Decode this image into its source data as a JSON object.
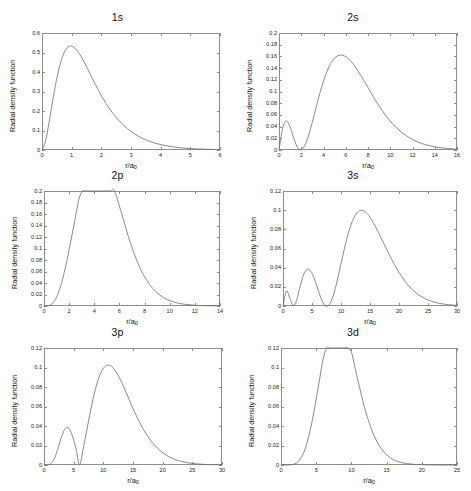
{
  "figure": {
    "title": "",
    "panel_count": 6,
    "axis": {
      "ylabel": "Radial density function",
      "xlabel_text": "r/a",
      "xlabel_sub": "0"
    },
    "style": {
      "curve_color": "#6b6b6b",
      "axis_color": "#8d8d8d",
      "text_color": "#111111",
      "background": "#ffffff"
    }
  },
  "chart_data": [
    {
      "type": "line",
      "title": "1s",
      "xlabel": "r/a0",
      "ylabel": "Radial density function",
      "xlim": [
        0,
        6
      ],
      "ylim": [
        0,
        0.6
      ],
      "xticks": [
        0,
        1,
        2,
        3,
        4,
        5,
        6
      ],
      "yticks": [
        0,
        0.1,
        0.2,
        0.3,
        0.4,
        0.5,
        0.6
      ],
      "xticklabels": [
        "0",
        "1",
        "2",
        "3",
        "4",
        "5",
        "6"
      ],
      "yticklabels": [
        "0",
        "0.1",
        "0.2",
        "0.3",
        "0.4",
        "0.5",
        "0.6"
      ],
      "grid": false,
      "legend": null,
      "formula": "4 r^2 exp(-2r)",
      "peak": {
        "x": 1.0,
        "y": 0.541
      },
      "nodes": [],
      "x": [
        0,
        0.12,
        0.24,
        0.36,
        0.48,
        0.6,
        0.72,
        0.84,
        0.96,
        1.08,
        1.2,
        1.32,
        1.44,
        1.56,
        1.68,
        1.8,
        1.92,
        2.04,
        2.16,
        2.28,
        2.4,
        2.64,
        2.88,
        3.12,
        3.36,
        3.6,
        3.84,
        4.08,
        4.32,
        4.56,
        4.8,
        5.04,
        5.28,
        5.52,
        5.76,
        6.0
      ],
      "y": [
        0,
        0.0453,
        0.1425,
        0.2516,
        0.3524,
        0.4337,
        0.4906,
        0.5227,
        0.5331,
        0.5263,
        0.5068,
        0.4787,
        0.4452,
        0.4089,
        0.3719,
        0.3355,
        0.3007,
        0.2682,
        0.2382,
        0.2109,
        0.1862,
        0.1436,
        0.1094,
        0.0826,
        0.0618,
        0.0459,
        0.0339,
        0.0249,
        0.0182,
        0.0133,
        0.0097,
        0.007,
        0.0051,
        0.0036,
        0.0026,
        0.0019
      ]
    },
    {
      "type": "line",
      "title": "2s",
      "xlabel": "r/a0",
      "ylabel": "Radial density function",
      "xlim": [
        0,
        16
      ],
      "ylim": [
        0,
        0.2
      ],
      "xticks": [
        0,
        2,
        4,
        6,
        8,
        10,
        12,
        14,
        16
      ],
      "yticks": [
        0,
        0.02,
        0.04,
        0.06,
        0.08,
        0.1,
        0.12,
        0.14,
        0.16,
        0.18,
        0.2
      ],
      "xticklabels": [
        "0",
        "2",
        "4",
        "6",
        "8",
        "10",
        "12",
        "14",
        "16"
      ],
      "yticklabels": [
        "0",
        "0.02",
        "0.04",
        "0.06",
        "0.08",
        "0.1",
        "0.12",
        "0.14",
        "0.16",
        "0.18",
        "0.2"
      ],
      "grid": false,
      "legend": null,
      "formula": "(1/8) r^2 (2-r)^2 exp(-r)",
      "peak": {
        "x": 5.24,
        "y": 0.191
      },
      "secondary_peak": {
        "x": 0.76,
        "y": 0.0513
      },
      "nodes": [
        2.0
      ],
      "x": [
        0,
        0.32,
        0.64,
        0.96,
        1.28,
        1.6,
        1.92,
        2.24,
        2.56,
        2.88,
        3.2,
        3.52,
        3.84,
        4.16,
        4.48,
        4.8,
        5.12,
        5.44,
        5.76,
        6.08,
        6.4,
        6.72,
        7.04,
        7.36,
        7.68,
        8.0,
        8.64,
        9.28,
        9.92,
        10.56,
        11.2,
        11.84,
        12.48,
        13.12,
        13.76,
        14.4,
        15.04,
        15.68,
        16.0
      ],
      "y": [
        0,
        0.0362,
        0.05,
        0.0409,
        0.023,
        0.0065,
        0.0002,
        0.005,
        0.0192,
        0.0396,
        0.0629,
        0.0864,
        0.1081,
        0.1268,
        0.1416,
        0.1524,
        0.1591,
        0.1621,
        0.1617,
        0.1585,
        0.153,
        0.1457,
        0.137,
        0.1274,
        0.1172,
        0.1068,
        0.0861,
        0.0673,
        0.0512,
        0.038,
        0.0276,
        0.0196,
        0.0137,
        0.0094,
        0.0064,
        0.0042,
        0.0028,
        0.0018,
        0.0014
      ]
    },
    {
      "type": "line",
      "title": "2p",
      "xlabel": "r/a0",
      "ylabel": "Radial density function",
      "xlim": [
        0,
        14
      ],
      "ylim": [
        0,
        0.2
      ],
      "xticks": [
        0,
        2,
        4,
        6,
        8,
        10,
        12,
        14
      ],
      "yticks": [
        0,
        0.02,
        0.04,
        0.06,
        0.08,
        0.1,
        0.12,
        0.14,
        0.16,
        0.18,
        0.2
      ],
      "xticklabels": [
        "0",
        "2",
        "4",
        "6",
        "8",
        "10",
        "12",
        "14"
      ],
      "yticklabels": [
        "0",
        "0.02",
        "0.04",
        "0.06",
        "0.08",
        "0.1",
        "0.12",
        "0.14",
        "0.16",
        "0.18",
        "0.2"
      ],
      "grid": false,
      "legend": null,
      "formula": "(1/24) r^4 exp(-r)",
      "peak": {
        "x": 4.0,
        "y": 0.1954
      },
      "nodes": [],
      "x": [
        0,
        0.28,
        0.56,
        0.84,
        1.12,
        1.4,
        1.68,
        1.96,
        2.24,
        2.52,
        2.8,
        3.08,
        3.36,
        3.64,
        3.92,
        4.2,
        4.48,
        4.76,
        5.04,
        5.32,
        5.6,
        6.16,
        6.72,
        7.28,
        7.84,
        8.4,
        8.96,
        9.52,
        10.08,
        10.64,
        11.2,
        11.76,
        12.32,
        12.88,
        13.44,
        14.0
      ],
      "y": [
        0,
        0.0002,
        0.0024,
        0.009,
        0.0216,
        0.0404,
        0.0648,
        0.0936,
        0.125,
        0.157,
        0.1876,
        0.2148,
        0.2371,
        0.2534,
        0.2631,
        0.2661,
        0.2629,
        0.2541,
        0.2407,
        0.2238,
        0.2044,
        0.162,
        0.1203,
        0.0849,
        0.0574,
        0.0374,
        0.0236,
        0.0145,
        0.0087,
        0.0051,
        0.003,
        0.0017,
        0.0009,
        0.0005,
        0.0003,
        0.0002
      ]
    },
    {
      "type": "line",
      "title": "3s",
      "xlabel": "r/a0",
      "ylabel": "Radial density function",
      "xlim": [
        0,
        30
      ],
      "ylim": [
        0,
        0.12
      ],
      "xticks": [
        0,
        5,
        10,
        15,
        20,
        25,
        30
      ],
      "yticks": [
        0,
        0.02,
        0.04,
        0.06,
        0.08,
        0.1,
        0.12
      ],
      "xticklabels": [
        "0",
        "5",
        "10",
        "15",
        "20",
        "25",
        "30"
      ],
      "yticklabels": [
        "0",
        "0.02",
        "0.04",
        "0.06",
        "0.08",
        "0.1",
        "0.12"
      ],
      "grid": false,
      "legend": null,
      "formula": "(4/2187) r^2 (27-18r+2r^2)^2 exp(-2r/3)",
      "peak": {
        "x": 13.07,
        "y": 0.1012
      },
      "secondary_peaks": [
        {
          "x": 0.74,
          "y": 0.0165
        },
        {
          "x": 4.19,
          "y": 0.0384
        }
      ],
      "nodes": [
        1.9,
        7.1
      ],
      "x": [
        0,
        0.6,
        1.2,
        1.8,
        2.4,
        3.0,
        3.6,
        4.2,
        4.8,
        5.4,
        6.0,
        6.6,
        7.2,
        7.8,
        8.4,
        9.0,
        9.6,
        10.2,
        10.8,
        11.4,
        12.0,
        12.6,
        13.2,
        13.8,
        14.4,
        15.0,
        16.2,
        17.4,
        18.6,
        19.8,
        21.0,
        22.2,
        23.4,
        24.6,
        25.8,
        27.0,
        28.2,
        29.4,
        30.0
      ],
      "y": [
        0,
        0.0157,
        0.008,
        0.0002,
        0.0069,
        0.0216,
        0.0333,
        0.0384,
        0.0363,
        0.0285,
        0.0178,
        0.0076,
        0.0009,
        0.0003,
        0.0062,
        0.0179,
        0.0331,
        0.0495,
        0.0652,
        0.0787,
        0.0891,
        0.096,
        0.0994,
        0.0996,
        0.0972,
        0.0927,
        0.0799,
        0.065,
        0.0502,
        0.037,
        0.0261,
        0.0177,
        0.0116,
        0.0074,
        0.0045,
        0.0027,
        0.0016,
        0.0009,
        0.0007
      ]
    },
    {
      "type": "line",
      "title": "3p",
      "xlabel": "r/a0",
      "ylabel": "Radial density function",
      "xlim": [
        0,
        30
      ],
      "ylim": [
        0,
        0.12
      ],
      "xticks": [
        0,
        5,
        10,
        15,
        20,
        25,
        30
      ],
      "yticks": [
        0,
        0.02,
        0.04,
        0.06,
        0.08,
        0.1,
        0.12
      ],
      "xticklabels": [
        "0",
        "5",
        "10",
        "15",
        "20",
        "25",
        "30"
      ],
      "yticklabels": [
        "0",
        "0.02",
        "0.04",
        "0.06",
        "0.08",
        "0.1",
        "0.12"
      ],
      "grid": false,
      "legend": null,
      "formula": "(8/19683) r^4 (6-r)^2 exp(-2r/3)",
      "peak": {
        "x": 12.0,
        "y": 0.1016
      },
      "secondary_peak": {
        "x": 3.28,
        "y": 0.0299
      },
      "nodes": [
        6.0
      ],
      "x": [
        0,
        0.6,
        1.2,
        1.8,
        2.4,
        3.0,
        3.6,
        4.2,
        4.8,
        5.4,
        6.0,
        6.6,
        7.2,
        7.8,
        8.4,
        9.0,
        9.6,
        10.2,
        10.8,
        11.4,
        12.0,
        12.6,
        13.2,
        13.8,
        14.4,
        15.0,
        16.2,
        17.4,
        18.6,
        19.8,
        21.0,
        22.2,
        23.4,
        24.6,
        25.8,
        27.0,
        28.2,
        29.4,
        30.0
      ],
      "y": [
        0,
        0.0001,
        0.0017,
        0.0073,
        0.0178,
        0.0296,
        0.0375,
        0.0376,
        0.0296,
        0.0166,
        0.0,
        0.0164,
        0.0353,
        0.0543,
        0.0713,
        0.0851,
        0.0949,
        0.1006,
        0.1025,
        0.1011,
        0.097,
        0.0909,
        0.0834,
        0.0751,
        0.0665,
        0.058,
        0.0427,
        0.0302,
        0.0206,
        0.0136,
        0.0087,
        0.0054,
        0.0033,
        0.0019,
        0.0011,
        0.0006,
        0.0004,
        0.0002,
        0.0001
      ]
    },
    {
      "type": "line",
      "title": "3d",
      "xlabel": "r/a0",
      "ylabel": "Radial density function",
      "xlim": [
        0,
        25
      ],
      "ylim": [
        0,
        0.12
      ],
      "xticks": [
        0,
        5,
        10,
        15,
        20,
        25
      ],
      "yticks": [
        0,
        0.02,
        0.04,
        0.06,
        0.08,
        0.1,
        0.12
      ],
      "xticklabels": [
        "0",
        "5",
        "10",
        "15",
        "20",
        "25"
      ],
      "yticklabels": [
        "0",
        "0.02",
        "0.04",
        "0.06",
        "0.08",
        "0.1",
        "0.12"
      ],
      "grid": false,
      "legend": null,
      "formula": "(8/98415) r^6 exp(-2r/3)",
      "peak": {
        "x": 9.0,
        "y": 0.1048
      },
      "nodes": [],
      "x": [
        0,
        0.5,
        1.0,
        1.5,
        2.0,
        2.5,
        3.0,
        3.5,
        4.0,
        4.5,
        5.0,
        5.5,
        6.0,
        6.5,
        7.0,
        7.5,
        8.0,
        8.5,
        9.0,
        9.5,
        10.0,
        10.5,
        11.0,
        12.0,
        13.0,
        14.0,
        15.0,
        16.0,
        17.0,
        18.0,
        19.0,
        20.0,
        21.0,
        22.0,
        23.0,
        24.0,
        25.0
      ],
      "y": [
        0,
        0.0,
        0.0,
        0.0003,
        0.0013,
        0.0039,
        0.0092,
        0.0181,
        0.0311,
        0.0479,
        0.0677,
        0.0888,
        0.1093,
        0.1272,
        0.1409,
        0.1493,
        0.152,
        0.1492,
        0.1415,
        0.13,
        0.1159,
        0.1003,
        0.0845,
        0.0555,
        0.0339,
        0.0194,
        0.0105,
        0.0054,
        0.0027,
        0.0013,
        0.0006,
        0.0003,
        0.0001,
        0.0,
        0.0,
        0.0,
        0.0
      ]
    }
  ]
}
